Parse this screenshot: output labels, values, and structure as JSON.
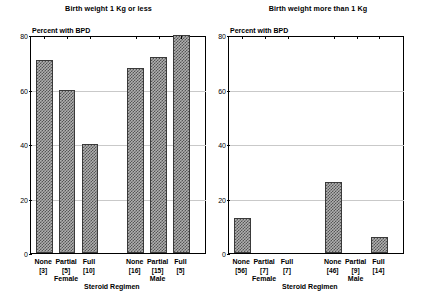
{
  "figure": {
    "y_axis_label": "Percent with BPD",
    "x_axis_title": "Steroid Regimen",
    "yticks": [
      "0",
      "20",
      "40",
      "60",
      "80"
    ]
  },
  "panels": [
    {
      "title": "Birth weight 1 Kg or less",
      "groups": [
        {
          "label": "Female",
          "bars": [
            {
              "name": "None",
              "count": "[3]",
              "value": 71
            },
            {
              "name": "Partial",
              "count": "[5]",
              "value": 60
            },
            {
              "name": "Full",
              "count": "[10]",
              "value": 40
            }
          ]
        },
        {
          "label": "Male",
          "bars": [
            {
              "name": "None",
              "count": "[16]",
              "value": 68
            },
            {
              "name": "Partial",
              "count": "[15]",
              "value": 72
            },
            {
              "name": "Full",
              "count": "[5]",
              "value": 80
            }
          ]
        }
      ]
    },
    {
      "title": "Birth weight more than 1 Kg",
      "groups": [
        {
          "label": "Female",
          "bars": [
            {
              "name": "None",
              "count": "[56]",
              "value": 13
            },
            {
              "name": "Partial",
              "count": "[7]",
              "value": 0
            },
            {
              "name": "Full",
              "count": "[7]",
              "value": 0
            }
          ]
        },
        {
          "label": "Male",
          "bars": [
            {
              "name": "None",
              "count": "[46]",
              "value": 26
            },
            {
              "name": "Partial",
              "count": "[9]",
              "value": 0
            },
            {
              "name": "Full",
              "count": "[14]",
              "value": 6
            }
          ]
        }
      ]
    }
  ],
  "chart_data": {
    "type": "bar",
    "xlabel": "Steroid Regimen",
    "ylabel": "Percent with BPD",
    "ylim": [
      0,
      80
    ],
    "yticks": [
      0,
      20,
      40,
      60,
      80
    ],
    "grid": true,
    "legend": "none",
    "panels": [
      {
        "title": "Birth weight 1 Kg or less",
        "categories": [
          "None [3]",
          "Partial [5]",
          "Full [10]",
          "None [16]",
          "Partial [15]",
          "Full [5]"
        ],
        "group_labels": [
          "Female",
          "Female",
          "Female",
          "Male",
          "Male",
          "Male"
        ],
        "values": [
          71,
          60,
          40,
          68,
          72,
          80
        ],
        "counts": [
          3,
          5,
          10,
          16,
          15,
          5
        ]
      },
      {
        "title": "Birth weight more than 1 Kg",
        "categories": [
          "None [56]",
          "Partial [7]",
          "Full [7]",
          "None [46]",
          "Partial [9]",
          "Full [14]"
        ],
        "group_labels": [
          "Female",
          "Female",
          "Female",
          "Male",
          "Male",
          "Male"
        ],
        "values": [
          13,
          0,
          0,
          26,
          0,
          6
        ],
        "counts": [
          56,
          7,
          7,
          46,
          9,
          14
        ]
      }
    ]
  }
}
